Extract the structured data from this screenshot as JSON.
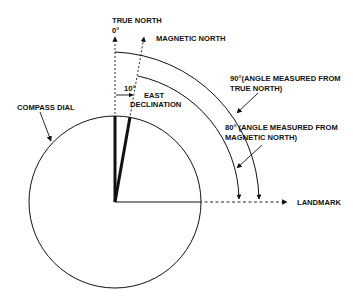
{
  "diagram": {
    "labels": {
      "true_north": "TRUE NORTH",
      "true_north_degree": "0°",
      "magnetic_north": "MAGNETIC NORTH",
      "declination_angle": "10°",
      "east_declination_line1": "EAST",
      "east_declination_line2": "DECLINATION",
      "compass_dial": "COMPASS DIAL",
      "true_angle_line1": "90°(ANGLE MEASURED FROM",
      "true_angle_line2": "TRUE NORTH)",
      "magnetic_angle_line1": "80° (ANGLE MEASURED FROM",
      "magnetic_angle_line2": "MAGNETIC NORTH)",
      "landmark": "LANDMARK"
    },
    "angles": {
      "declination_deg": 10,
      "from_true_north_deg": 90,
      "from_magnetic_north_deg": 80
    },
    "colors": {
      "ink": "#111111",
      "background": "#ffffff"
    }
  }
}
